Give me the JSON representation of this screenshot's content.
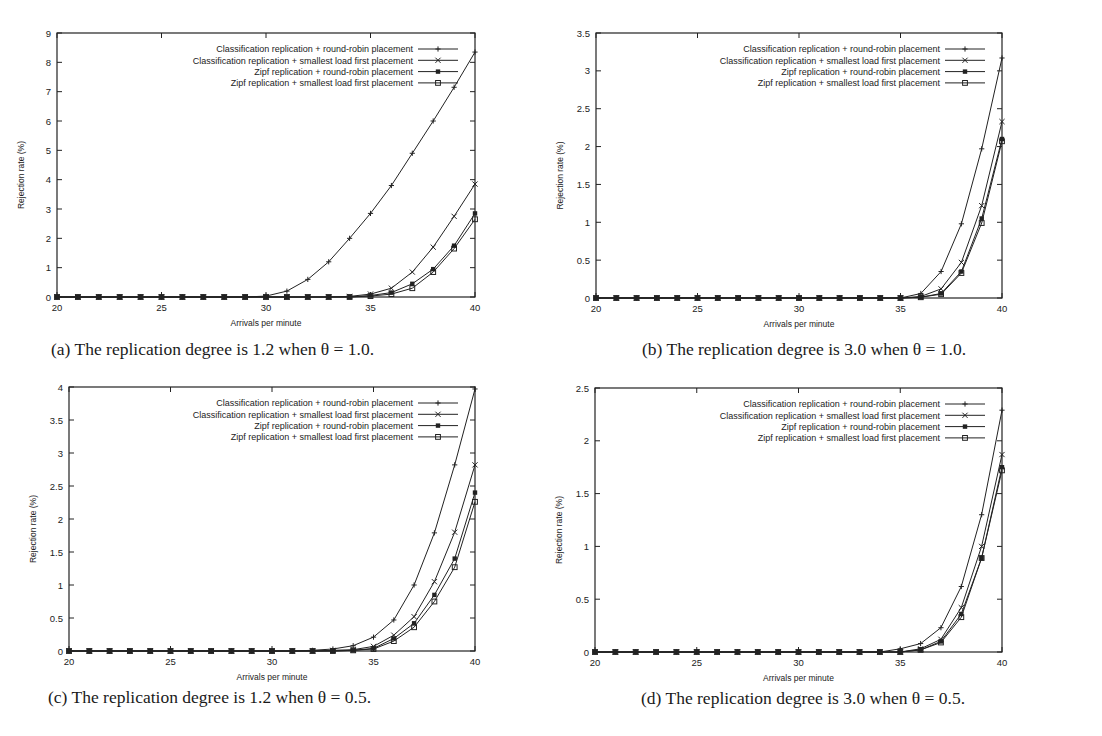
{
  "figure": {
    "legend": [
      "Classification replication + round-robin placement",
      "Classification replication + smallest load first placement",
      "Zipf replication + round-robin placement",
      "Zipf replication + smallest load first placement"
    ],
    "markers": [
      "plus",
      "cross",
      "filled-square",
      "open-square"
    ],
    "xlabel": "Arrivals per minute",
    "ylabel": "Rejection rate (%)",
    "line_color": "#222222"
  },
  "chart_data": [
    {
      "type": "line",
      "id": "a",
      "title": "(a) The replication degree is 1.2 when θ = 1.0.",
      "xlabel": "Arrivals per minute",
      "ylabel": "Rejection rate (%)",
      "xlim": [
        20,
        40
      ],
      "ylim": [
        0,
        9
      ],
      "xticks": [
        20,
        25,
        30,
        35,
        40
      ],
      "yticks": [
        0,
        1,
        2,
        3,
        4,
        5,
        6,
        7,
        8,
        9
      ],
      "ytick_labels": [
        "0",
        "1",
        "2",
        "3",
        "4",
        "5",
        "6",
        "7",
        "8",
        "9"
      ],
      "grid": false,
      "legend_position": "upper right",
      "x": [
        20,
        21,
        22,
        23,
        24,
        25,
        26,
        27,
        28,
        29,
        30,
        31,
        32,
        33,
        34,
        35,
        36,
        37,
        38,
        39,
        40
      ],
      "series": [
        {
          "name": "Classification replication + round-robin placement",
          "values": [
            0,
            0,
            0,
            0,
            0,
            0,
            0,
            0,
            0,
            0,
            0.03,
            0.2,
            0.6,
            1.2,
            2.0,
            2.85,
            3.8,
            4.9,
            6.0,
            7.15,
            8.35
          ]
        },
        {
          "name": "Classification replication + smallest load first placement",
          "values": [
            0,
            0,
            0,
            0,
            0,
            0,
            0,
            0,
            0,
            0,
            0,
            0,
            0,
            0,
            0.02,
            0.1,
            0.3,
            0.85,
            1.7,
            2.75,
            3.85
          ]
        },
        {
          "name": "Zipf replication + round-robin placement",
          "values": [
            0,
            0,
            0,
            0,
            0,
            0,
            0,
            0,
            0,
            0,
            0,
            0,
            0,
            0,
            0,
            0.05,
            0.15,
            0.45,
            0.95,
            1.75,
            2.85
          ]
        },
        {
          "name": "Zipf replication + smallest load first placement",
          "values": [
            0,
            0,
            0,
            0,
            0,
            0,
            0,
            0,
            0,
            0,
            0,
            0,
            0,
            0,
            0,
            0.03,
            0.1,
            0.3,
            0.85,
            1.65,
            2.65
          ]
        }
      ]
    },
    {
      "type": "line",
      "id": "b",
      "title": "(b) The replication degree is 3.0 when θ = 1.0.",
      "xlabel": "Arrivals per minute",
      "ylabel": "Rejection rate (%)",
      "xlim": [
        20,
        40
      ],
      "ylim": [
        0,
        3.5
      ],
      "xticks": [
        20,
        25,
        30,
        35,
        40
      ],
      "yticks": [
        0,
        0.5,
        1,
        1.5,
        2,
        2.5,
        3,
        3.5
      ],
      "ytick_labels": [
        "0",
        "0.5",
        "1",
        "1.5",
        "2",
        "2.5",
        "3",
        "3.5"
      ],
      "grid": false,
      "legend_position": "upper right",
      "x": [
        20,
        21,
        22,
        23,
        24,
        25,
        26,
        27,
        28,
        29,
        30,
        31,
        32,
        33,
        34,
        35,
        36,
        37,
        38,
        39,
        40
      ],
      "series": [
        {
          "name": "Classification replication + round-robin placement",
          "values": [
            0,
            0,
            0,
            0,
            0,
            0,
            0,
            0,
            0,
            0,
            0,
            0,
            0,
            0,
            0,
            0,
            0.06,
            0.35,
            0.98,
            1.97,
            3.17
          ]
        },
        {
          "name": "Classification replication + smallest load first placement",
          "values": [
            0,
            0,
            0,
            0,
            0,
            0,
            0,
            0,
            0,
            0,
            0,
            0,
            0,
            0,
            0,
            0,
            0.02,
            0.12,
            0.47,
            1.22,
            2.33
          ]
        },
        {
          "name": "Zipf replication + round-robin placement",
          "values": [
            0,
            0,
            0,
            0,
            0,
            0,
            0,
            0,
            0,
            0,
            0,
            0,
            0,
            0,
            0,
            0,
            0.01,
            0.06,
            0.35,
            1.05,
            2.1
          ]
        },
        {
          "name": "Zipf replication + smallest load first placement",
          "values": [
            0,
            0,
            0,
            0,
            0,
            0,
            0,
            0,
            0,
            0,
            0,
            0,
            0,
            0,
            0,
            0,
            0.01,
            0.05,
            0.33,
            0.99,
            2.07
          ]
        }
      ]
    },
    {
      "type": "line",
      "id": "c",
      "title": "(c) The replication degree is 1.2 when θ = 0.5.",
      "xlabel": "Arrivals per minute",
      "ylabel": "Rejection rate (%)",
      "xlim": [
        20,
        40
      ],
      "ylim": [
        0,
        4
      ],
      "xticks": [
        20,
        25,
        30,
        35,
        40
      ],
      "yticks": [
        0,
        0.5,
        1,
        1.5,
        2,
        2.5,
        3,
        3.5,
        4
      ],
      "ytick_labels": [
        "0",
        "0.5",
        "1",
        "1.5",
        "2",
        "2.5",
        "3",
        "3.5",
        "4"
      ],
      "grid": false,
      "legend_position": "upper right",
      "x": [
        20,
        21,
        22,
        23,
        24,
        25,
        26,
        27,
        28,
        29,
        30,
        31,
        32,
        33,
        34,
        35,
        36,
        37,
        38,
        39,
        40
      ],
      "series": [
        {
          "name": "Classification replication + round-robin placement",
          "values": [
            0,
            0,
            0,
            0,
            0,
            0,
            0,
            0,
            0,
            0,
            0,
            0,
            0.01,
            0.03,
            0.08,
            0.21,
            0.47,
            1.0,
            1.79,
            2.82,
            3.97
          ]
        },
        {
          "name": "Classification replication + smallest load first placement",
          "values": [
            0,
            0,
            0,
            0,
            0,
            0,
            0,
            0,
            0,
            0,
            0,
            0,
            0,
            0.01,
            0.02,
            0.07,
            0.24,
            0.52,
            1.05,
            1.8,
            2.82
          ]
        },
        {
          "name": "Zipf replication + round-robin placement",
          "values": [
            0,
            0,
            0,
            0,
            0,
            0,
            0,
            0,
            0,
            0,
            0,
            0,
            0,
            0,
            0.01,
            0.04,
            0.19,
            0.42,
            0.85,
            1.4,
            2.4
          ]
        },
        {
          "name": "Zipf replication + smallest load first placement",
          "values": [
            0,
            0,
            0,
            0,
            0,
            0,
            0,
            0,
            0,
            0,
            0,
            0,
            0,
            0,
            0.01,
            0.03,
            0.15,
            0.36,
            0.75,
            1.27,
            2.26
          ]
        }
      ]
    },
    {
      "type": "line",
      "id": "d",
      "title": "(d) The replication degree is 3.0 when θ = 0.5.",
      "xlabel": "Arrivals per minute",
      "ylabel": "Rejection rate (%)",
      "xlim": [
        20,
        40
      ],
      "ylim": [
        0,
        2.5
      ],
      "xticks": [
        20,
        25,
        30,
        35,
        40
      ],
      "yticks": [
        0,
        0.5,
        1,
        1.5,
        2,
        2.5
      ],
      "ytick_labels": [
        "0",
        "0.5",
        "1",
        "1.5",
        "2",
        "2.5"
      ],
      "grid": false,
      "legend_position": "upper right",
      "x": [
        20,
        21,
        22,
        23,
        24,
        25,
        26,
        27,
        28,
        29,
        30,
        31,
        32,
        33,
        34,
        35,
        36,
        37,
        38,
        39,
        40
      ],
      "series": [
        {
          "name": "Classification replication + round-robin placement",
          "values": [
            0,
            0,
            0,
            0,
            0,
            0,
            0,
            0,
            0,
            0,
            0,
            0,
            0,
            0,
            0,
            0.03,
            0.08,
            0.23,
            0.62,
            1.3,
            2.29
          ]
        },
        {
          "name": "Classification replication + smallest load first placement",
          "values": [
            0,
            0,
            0,
            0,
            0,
            0,
            0,
            0,
            0,
            0,
            0,
            0,
            0,
            0,
            0,
            0,
            0.03,
            0.12,
            0.42,
            1.0,
            1.87
          ]
        },
        {
          "name": "Zipf replication + round-robin placement",
          "values": [
            0,
            0,
            0,
            0,
            0,
            0,
            0,
            0,
            0,
            0,
            0,
            0,
            0,
            0,
            0,
            0,
            0.02,
            0.1,
            0.36,
            0.89,
            1.75
          ]
        },
        {
          "name": "Zipf replication + smallest load first placement",
          "values": [
            0,
            0,
            0,
            0,
            0,
            0,
            0,
            0,
            0,
            0,
            0,
            0,
            0,
            0,
            0,
            0,
            0.02,
            0.09,
            0.33,
            0.89,
            1.72
          ]
        }
      ]
    }
  ]
}
